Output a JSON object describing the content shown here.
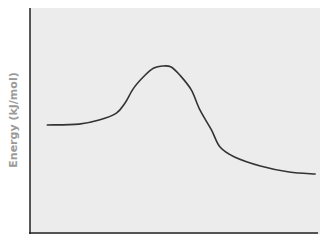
{
  "chart_data": {
    "type": "line",
    "title": "",
    "xlabel": "",
    "ylabel": "Energy (kJ/mol)",
    "xlim": [
      0,
      100
    ],
    "ylim": [
      0,
      100
    ],
    "grid": false,
    "legend": null,
    "x_ticks": [],
    "y_ticks": [],
    "series": [
      {
        "name": "reaction energy profile",
        "color": "#333333",
        "x": [
          6,
          17,
          24,
          30,
          33,
          36,
          40,
          43,
          46,
          49,
          52,
          56,
          59,
          63,
          66,
          71,
          80,
          90,
          99
        ],
        "y": [
          48,
          48.4,
          50.2,
          53.3,
          57.8,
          64.4,
          70.2,
          73.3,
          74.2,
          73.8,
          70.2,
          63.6,
          54.7,
          45.8,
          38.2,
          33.8,
          29.8,
          27.1,
          26.2
        ]
      }
    ],
    "background_color": "#ececec",
    "axis_color": "#222222"
  }
}
